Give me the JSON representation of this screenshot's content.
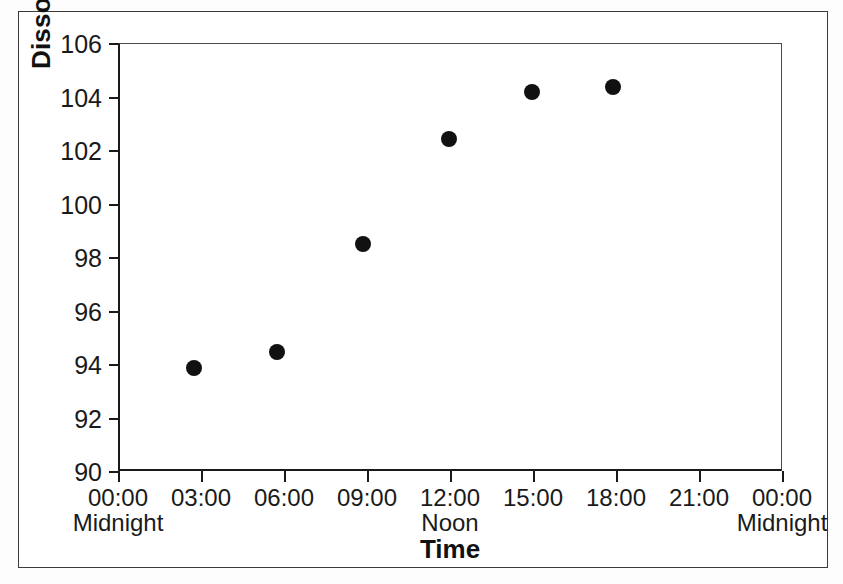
{
  "chart_data": {
    "type": "scatter",
    "title": "",
    "xlabel": "Time",
    "ylabel": "Dissolved Oxygen (% saturation)",
    "ylim": [
      90,
      106
    ],
    "yticks": [
      90,
      92,
      94,
      96,
      98,
      100,
      102,
      104,
      106
    ],
    "ytick_labels": [
      "90",
      "92",
      "94",
      "96",
      "98",
      "100",
      "102",
      "104",
      "106"
    ],
    "xlim_hours": [
      0,
      24
    ],
    "xticks_hours": [
      0,
      3,
      6,
      9,
      12,
      15,
      18,
      21,
      24
    ],
    "xtick_labels": [
      "00:00",
      "03:00",
      "06:00",
      "09:00",
      "12:00",
      "15:00",
      "18:00",
      "21:00",
      "00:00"
    ],
    "xtick_sublabels": [
      "Midnight",
      "",
      "",
      "",
      "Noon",
      "",
      "",
      "",
      "Midnight"
    ],
    "grid": false,
    "legend": false,
    "marker": "filled-circle",
    "marker_color": "#111111",
    "series": [
      {
        "name": "Dissolved Oxygen",
        "points": [
          {
            "x_hours": 2.75,
            "x_label": "03:00",
            "y": 93.85
          },
          {
            "x_hours": 5.75,
            "x_label": "06:00",
            "y": 94.45
          },
          {
            "x_hours": 8.85,
            "x_label": "09:00",
            "y": 98.5
          },
          {
            "x_hours": 11.95,
            "x_label": "12:00",
            "y": 102.4
          },
          {
            "x_hours": 14.95,
            "x_label": "15:00",
            "y": 104.15
          },
          {
            "x_hours": 17.9,
            "x_label": "18:00",
            "y": 104.35
          }
        ]
      }
    ]
  },
  "colors": {
    "background": "#ffffff",
    "frame": "#3a3a3a",
    "axis": "#1a1a1a",
    "marker": "#111111"
  }
}
